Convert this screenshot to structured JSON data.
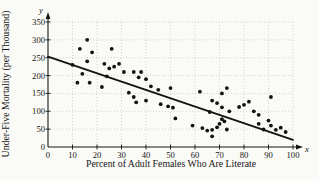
{
  "figure": {
    "background": "#fafaf7"
  },
  "chart_data": {
    "type": "scatter",
    "title": "",
    "xlabel": "Percent of Adult Females Who Are Literate",
    "ylabel": "Under-Five Mortality (per Thousand)",
    "axis_letters": {
      "x": "x",
      "y": "y"
    },
    "xlim": [
      0,
      100
    ],
    "ylim": [
      0,
      350
    ],
    "x_ticks": [
      0,
      10,
      20,
      30,
      40,
      50,
      60,
      70,
      80,
      90,
      100
    ],
    "y_ticks": [
      0,
      50,
      100,
      150,
      200,
      250,
      300,
      350
    ],
    "grid": true,
    "grid_style": "dotted",
    "legend": "none",
    "points": [
      [
        10,
        230
      ],
      [
        12,
        180
      ],
      [
        13,
        275
      ],
      [
        14,
        205
      ],
      [
        16,
        240
      ],
      [
        16,
        300
      ],
      [
        17,
        180
      ],
      [
        18,
        265
      ],
      [
        22,
        168
      ],
      [
        23,
        233
      ],
      [
        24,
        198
      ],
      [
        25,
        220
      ],
      [
        26,
        275
      ],
      [
        27,
        225
      ],
      [
        29,
        233
      ],
      [
        31,
        210
      ],
      [
        33,
        152
      ],
      [
        35,
        140
      ],
      [
        35,
        210
      ],
      [
        36,
        125
      ],
      [
        37,
        195
      ],
      [
        38,
        210
      ],
      [
        40,
        130
      ],
      [
        40,
        190
      ],
      [
        42,
        170
      ],
      [
        45,
        160
      ],
      [
        46,
        120
      ],
      [
        49,
        114
      ],
      [
        50,
        165
      ],
      [
        51,
        110
      ],
      [
        52,
        80
      ],
      [
        59,
        60
      ],
      [
        62,
        155
      ],
      [
        63,
        53
      ],
      [
        65,
        46
      ],
      [
        66,
        98
      ],
      [
        67,
        30
      ],
      [
        67,
        48
      ],
      [
        67,
        130
      ],
      [
        69,
        55
      ],
      [
        69,
        123
      ],
      [
        70,
        65
      ],
      [
        71,
        78
      ],
      [
        71,
        111
      ],
      [
        71,
        150
      ],
      [
        72,
        72
      ],
      [
        73,
        49
      ],
      [
        73,
        165
      ],
      [
        74,
        100
      ],
      [
        78,
        112
      ],
      [
        80,
        118
      ],
      [
        82,
        127
      ],
      [
        84,
        100
      ],
      [
        86,
        65
      ],
      [
        86,
        90
      ],
      [
        88,
        49
      ],
      [
        90,
        74
      ],
      [
        91,
        60
      ],
      [
        91,
        140
      ],
      [
        93,
        48
      ],
      [
        95,
        54
      ],
      [
        97,
        42
      ]
    ],
    "trend_line": {
      "x1": 0,
      "y1": 253,
      "x2": 100,
      "y2": 20
    },
    "colors": {
      "points": "#121212",
      "trend_line": "#121212",
      "grid": "#c2c2c0",
      "axis": "#161616",
      "text": "#161616"
    }
  }
}
